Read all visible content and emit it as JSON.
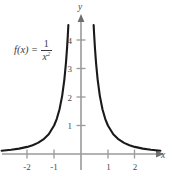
{
  "figure": {
    "background_color": "#ffffff",
    "width": 172,
    "height": 177,
    "function_label": {
      "lhs": "f(x)",
      "equals": "=",
      "numerator": "1",
      "denominator_base": "x",
      "denominator_exponent": "2",
      "plain": "f(x) = 1/x^2"
    },
    "bottom_strip_text": ""
  },
  "chart_data": {
    "type": "line",
    "title": "",
    "subtitle": "",
    "xlabel": "x",
    "ylabel": "y",
    "function": "f(x) = 1/x^2",
    "annotations": [
      {
        "text": "f(x) = 1/x^2",
        "x": -1.9,
        "y": 3.6
      }
    ],
    "xlim": [
      -2.95,
      3.1
    ],
    "ylim": [
      -0.6,
      4.9
    ],
    "xticks": [
      -2,
      -1,
      1,
      2
    ],
    "xtick_labels": [
      "-2",
      "-1",
      "1",
      "2"
    ],
    "yticks": [
      1,
      2,
      3,
      4
    ],
    "ytick_labels": [
      "1",
      "2",
      "3",
      "4"
    ],
    "grid": false,
    "legend": "none",
    "axis_color": "#9a9a9a",
    "curve_color": "#1a1a1a",
    "tick_label_color": "#4a4a4a",
    "series": [
      {
        "name": "left branch of f(x) = 1/x^2",
        "x": [
          -2.95,
          -2.6,
          -2.3,
          -2.0,
          -1.8,
          -1.6,
          -1.4,
          -1.2,
          -1.0,
          -0.9,
          -0.8,
          -0.7,
          -0.62,
          -0.56,
          -0.52,
          -0.49,
          -0.47
        ],
        "values": [
          0.115,
          0.148,
          0.189,
          0.25,
          0.309,
          0.391,
          0.51,
          0.694,
          1.0,
          1.235,
          1.563,
          2.041,
          2.601,
          3.189,
          3.698,
          4.165,
          4.527
        ]
      },
      {
        "name": "right branch of f(x) = 1/x^2",
        "x": [
          0.47,
          0.49,
          0.52,
          0.56,
          0.62,
          0.7,
          0.8,
          0.9,
          1.0,
          1.2,
          1.4,
          1.6,
          1.8,
          2.0,
          2.3,
          2.6,
          2.95
        ],
        "values": [
          4.527,
          4.165,
          3.698,
          3.189,
          2.601,
          2.041,
          1.563,
          1.235,
          1.0,
          0.694,
          0.51,
          0.391,
          0.309,
          0.25,
          0.189,
          0.148,
          0.115
        ]
      }
    ]
  }
}
